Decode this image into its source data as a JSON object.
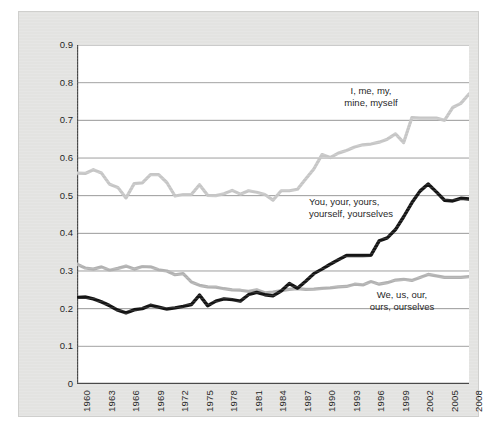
{
  "chart_data": {
    "type": "line",
    "title": "",
    "subtitle": "",
    "xlabel": "",
    "ylabel": "",
    "xlim": [
      1960,
      2008
    ],
    "ylim": [
      0,
      0.9
    ],
    "grid": true,
    "grid_axis": "y",
    "legend_position": "inline-annotations",
    "y_ticks": [
      "0.9",
      "0.8",
      "0.7",
      "0.6",
      "0.5",
      "0.4",
      "0.3",
      "0.2",
      "0.1",
      "0"
    ],
    "y_tick_values": [
      0.9,
      0.8,
      0.7,
      0.6,
      0.5,
      0.4,
      0.3,
      0.2,
      0.1,
      0
    ],
    "x_ticks": [
      "1960",
      "1963",
      "1966",
      "1969",
      "1972",
      "1975",
      "1978",
      "1981",
      "1984",
      "1987",
      "1990",
      "1993",
      "1996",
      "1999",
      "2002",
      "2005",
      "2008"
    ],
    "x_tick_values": [
      1960,
      1963,
      1966,
      1969,
      1972,
      1975,
      1978,
      1981,
      1984,
      1987,
      1990,
      1993,
      1996,
      1999,
      2002,
      2005,
      2008
    ],
    "x": [
      1960,
      1961,
      1962,
      1963,
      1964,
      1965,
      1966,
      1967,
      1968,
      1969,
      1970,
      1971,
      1972,
      1973,
      1974,
      1975,
      1976,
      1977,
      1978,
      1979,
      1980,
      1981,
      1982,
      1983,
      1984,
      1985,
      1986,
      1987,
      1988,
      1989,
      1990,
      1991,
      1992,
      1993,
      1994,
      1995,
      1996,
      1997,
      1998,
      1999,
      2000,
      2001,
      2002,
      2003,
      2004,
      2005,
      2006,
      2007,
      2008
    ],
    "series": [
      {
        "name": "I, me, my, mine, myself",
        "color": "#c6c6c6",
        "values": [
          0.56,
          0.559,
          0.569,
          0.56,
          0.53,
          0.522,
          0.494,
          0.532,
          0.534,
          0.556,
          0.556,
          0.535,
          0.499,
          0.503,
          0.503,
          0.529,
          0.501,
          0.5,
          0.505,
          0.514,
          0.504,
          0.513,
          0.509,
          0.503,
          0.488,
          0.513,
          0.513,
          0.517,
          0.544,
          0.571,
          0.609,
          0.601,
          0.613,
          0.62,
          0.629,
          0.635,
          0.637,
          0.642,
          0.65,
          0.664,
          0.641,
          0.707,
          0.706,
          0.706,
          0.706,
          0.7,
          0.734,
          0.745,
          0.77
        ]
      },
      {
        "name": "You, your, yours, yourself, yourselves",
        "color": "#151515",
        "values": [
          0.23,
          0.231,
          0.226,
          0.218,
          0.208,
          0.196,
          0.189,
          0.197,
          0.2,
          0.209,
          0.204,
          0.199,
          0.202,
          0.206,
          0.211,
          0.236,
          0.208,
          0.22,
          0.226,
          0.224,
          0.22,
          0.237,
          0.243,
          0.237,
          0.234,
          0.247,
          0.267,
          0.254,
          0.273,
          0.293,
          0.305,
          0.318,
          0.33,
          0.341,
          0.341,
          0.341,
          0.342,
          0.38,
          0.388,
          0.41,
          0.444,
          0.481,
          0.512,
          0.531,
          0.51,
          0.488,
          0.486,
          0.493,
          0.491
        ]
      },
      {
        "name": "We, us, our, ours, ourselves",
        "color": "#b2b2b2",
        "values": [
          0.318,
          0.308,
          0.305,
          0.311,
          0.302,
          0.307,
          0.313,
          0.305,
          0.312,
          0.311,
          0.303,
          0.3,
          0.29,
          0.293,
          0.271,
          0.262,
          0.258,
          0.257,
          0.253,
          0.25,
          0.249,
          0.246,
          0.25,
          0.242,
          0.244,
          0.248,
          0.251,
          0.253,
          0.251,
          0.252,
          0.254,
          0.255,
          0.258,
          0.259,
          0.265,
          0.263,
          0.272,
          0.265,
          0.269,
          0.276,
          0.278,
          0.275,
          0.283,
          0.291,
          0.287,
          0.283,
          0.283,
          0.283,
          0.285
        ]
      }
    ],
    "annotations": [
      {
        "id": "first",
        "line1": "I, me, my,",
        "line2": "mine, myself"
      },
      {
        "id": "second",
        "line1": "You, your, yours,",
        "line2": "yourself, yourselves"
      },
      {
        "id": "third",
        "line1": "We, us, our,",
        "line2": "ours, ourselves"
      }
    ]
  },
  "colors": {
    "panel_background": "#e3e3e1",
    "plot_background": "#ffffff",
    "axis": "#4a4a4a",
    "gridline": "#8c8c8c",
    "text": "#1b1b1b"
  }
}
